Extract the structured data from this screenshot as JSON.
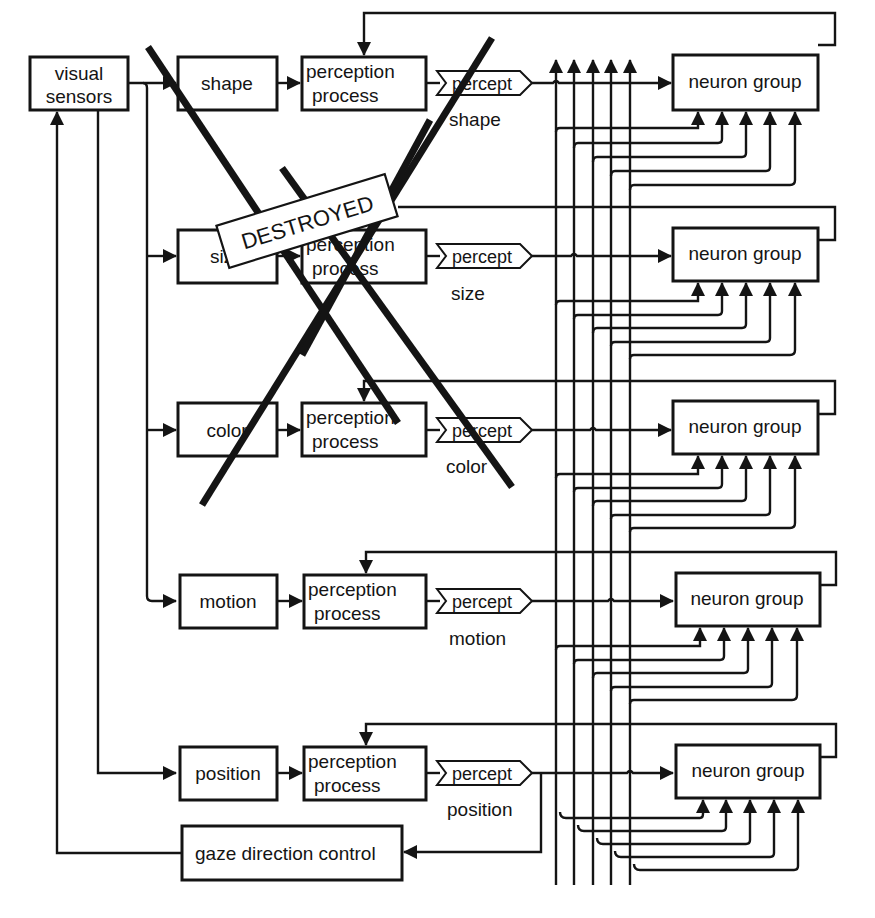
{
  "diagram": {
    "sensors": {
      "line1": "visual",
      "line2": "sensors"
    },
    "process_label": {
      "line1": "perception",
      "line2": "process"
    },
    "percept_label": "percept",
    "neuron_label": "neuron group",
    "gaze_label": "gaze direction control",
    "destroyed_label": "DESTROYED",
    "rows": [
      {
        "feature": "shape",
        "percept_caption": "shape",
        "destroyed": true
      },
      {
        "feature": "size",
        "percept_caption": "size",
        "destroyed": true
      },
      {
        "feature": "color",
        "percept_caption": "color",
        "destroyed": true
      },
      {
        "feature": "motion",
        "percept_caption": "motion",
        "destroyed": false
      },
      {
        "feature": "position",
        "percept_caption": "position",
        "destroyed": false
      }
    ],
    "colors": {
      "ink": "#141414",
      "paper": "#ffffff"
    }
  }
}
